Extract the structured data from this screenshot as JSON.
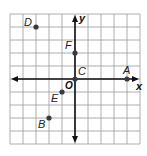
{
  "diagram": {
    "type": "coordinate-plane",
    "x_range": [
      -5,
      5
    ],
    "y_range": [
      -5,
      5
    ],
    "grid_step": 1,
    "axis_labels": {
      "x": "x",
      "y": "y"
    },
    "origin_label": "O",
    "points": [
      {
        "label": "A",
        "x": 4,
        "y": 0,
        "label_pos": "above"
      },
      {
        "label": "B",
        "x": -2,
        "y": -3,
        "label_pos": "below-left"
      },
      {
        "label": "C",
        "x": 0,
        "y": 0,
        "label_pos": "above-right"
      },
      {
        "label": "D",
        "x": -3,
        "y": 4,
        "label_pos": "left"
      },
      {
        "label": "E",
        "x": -1,
        "y": -1,
        "label_pos": "below-left"
      },
      {
        "label": "F",
        "x": 0,
        "y": 2,
        "label_pos": "above-left"
      }
    ],
    "colors": {
      "grid": "#9a9a9a",
      "axis": "#111111",
      "point": "#3a3a3a"
    }
  }
}
